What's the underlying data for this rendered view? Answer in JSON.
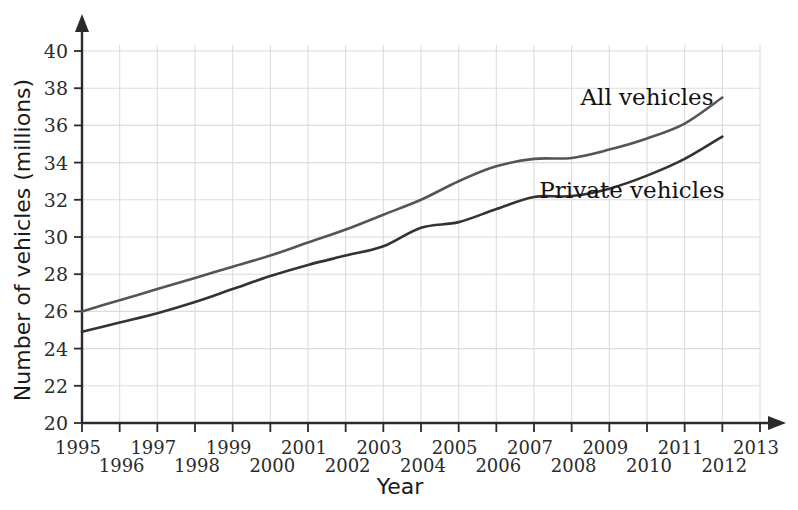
{
  "chart_data": {
    "type": "line",
    "title": "",
    "xlabel": "Year",
    "ylabel": "Number of vehicles (millions)",
    "xlim": [
      1995,
      2013
    ],
    "ylim": [
      20,
      40
    ],
    "grid": true,
    "legend_position": "inline-annotations",
    "x": [
      1995,
      1996,
      1997,
      1998,
      1999,
      2000,
      2001,
      2002,
      2003,
      2004,
      2005,
      2006,
      2007,
      2008,
      2009,
      2010,
      2011,
      2012
    ],
    "xtick_labels": [
      "1995",
      "1996",
      "1997",
      "1998",
      "1999",
      "2000",
      "2001",
      "2002",
      "2003",
      "2004",
      "2005",
      "2006",
      "2007",
      "2008",
      "2009",
      "2010",
      "2011",
      "2012",
      "2013"
    ],
    "xticks": [
      1995,
      1996,
      1997,
      1998,
      1999,
      2000,
      2001,
      2002,
      2003,
      2004,
      2005,
      2006,
      2007,
      2008,
      2009,
      2010,
      2011,
      2012,
      2013
    ],
    "ytick_labels": [
      "20",
      "22",
      "24",
      "26",
      "28",
      "30",
      "32",
      "34",
      "36",
      "38",
      "40"
    ],
    "yticks": [
      20,
      22,
      24,
      26,
      28,
      30,
      32,
      34,
      36,
      38,
      40
    ],
    "series": [
      {
        "name": "All vehicles",
        "color": "#555555",
        "values": [
          26.0,
          26.6,
          27.2,
          27.8,
          28.4,
          29.0,
          29.7,
          30.4,
          31.2,
          32.0,
          33.0,
          33.8,
          34.2,
          34.25,
          34.7,
          35.3,
          36.1,
          37.5
        ]
      },
      {
        "name": "Private vehicles",
        "color": "#333333",
        "values": [
          24.9,
          25.4,
          25.9,
          26.5,
          27.2,
          27.9,
          28.5,
          29.0,
          29.5,
          30.5,
          30.8,
          31.5,
          32.15,
          32.2,
          32.6,
          33.3,
          34.2,
          35.4
        ]
      }
    ],
    "annotations": [
      {
        "text": "All vehicles",
        "x": 2010.0,
        "y": 37.1
      },
      {
        "text": "Private vehicles",
        "x": 2009.6,
        "y": 32.1
      }
    ]
  },
  "axes": {
    "y_axis_title": "Number of vehicles (millions)",
    "x_axis_title": "Year"
  }
}
